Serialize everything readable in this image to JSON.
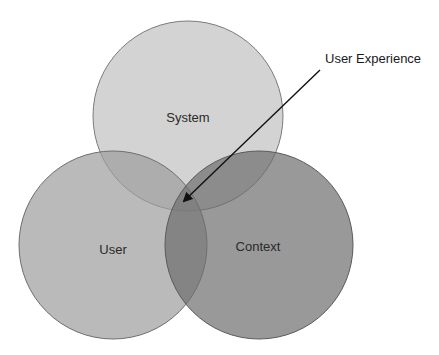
{
  "diagram": {
    "type": "venn",
    "title": "",
    "circles": [
      {
        "id": "system",
        "label": "System",
        "cx": 188,
        "cy": 116,
        "r": 95,
        "fill": "#c4c4c4",
        "fill_opacity": 0.75,
        "stroke": "#7a7a7a",
        "label_x": 188,
        "label_y": 122
      },
      {
        "id": "user",
        "label": "User",
        "cx": 113,
        "cy": 245,
        "r": 94,
        "fill": "#9c9c9c",
        "fill_opacity": 0.7,
        "stroke": "#6e6e6e",
        "label_x": 113,
        "label_y": 254
      },
      {
        "id": "context",
        "label": "Context",
        "cx": 259,
        "cy": 245,
        "r": 94,
        "fill": "#6e6e6e",
        "fill_opacity": 0.7,
        "stroke": "#5a5a5a",
        "label_x": 258,
        "label_y": 251
      }
    ],
    "callout": {
      "label": "User Experience",
      "label_x": 325,
      "label_y": 63,
      "arrow_from": [
        320,
        70
      ],
      "arrow_to": [
        184,
        201
      ],
      "color": "#111111"
    },
    "colors": {
      "background": "#ffffff",
      "system_only": "#d0d0d0",
      "user_only": "#b8b8b8",
      "context_only": "#9a9a9a",
      "triple_overlap": "#707070"
    }
  }
}
